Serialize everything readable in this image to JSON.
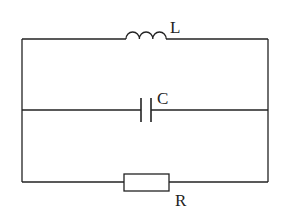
{
  "diagram": {
    "type": "parallel RLC circuit",
    "components": [
      {
        "id": "inductor",
        "label": "L",
        "branch": "top"
      },
      {
        "id": "capacitor",
        "label": "C",
        "branch": "middle"
      },
      {
        "id": "resistor",
        "label": "R",
        "branch": "bottom"
      }
    ],
    "colors": {
      "wire": "#222222",
      "background": "#ffffff"
    }
  }
}
